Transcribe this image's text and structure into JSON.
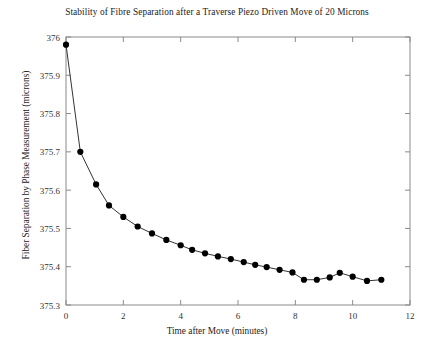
{
  "chart_data": {
    "type": "line",
    "title": "Stability of Fibre Separation after a Traverse Piezo Driven Move of 20 Microns",
    "xlabel": "Time after Move (minutes)",
    "ylabel": "Fiber Separation by Phase Measurement (microns)",
    "xlim": [
      0,
      12
    ],
    "ylim": [
      375.3,
      376.0
    ],
    "xticks": [
      0,
      2,
      4,
      6,
      8,
      10,
      12
    ],
    "xtick_labels": [
      "0",
      "2",
      "4",
      "6",
      "8",
      "10",
      "12"
    ],
    "yticks": [
      375.3,
      375.4,
      375.5,
      375.6,
      375.7,
      375.8,
      375.9,
      376.0
    ],
    "ytick_labels": [
      "375.3",
      "375.4",
      "375.5",
      "375.6",
      "375.7",
      "375.8",
      "375.9",
      "376"
    ],
    "grid": false,
    "legend": "none",
    "marker": "filled-circle",
    "marker_color": "#000000",
    "line_color": "#333333",
    "series": [
      {
        "name": "Fibre separation",
        "x": [
          0.0,
          0.5,
          1.05,
          1.5,
          2.0,
          2.5,
          3.0,
          3.5,
          4.0,
          4.4,
          4.85,
          5.3,
          5.75,
          6.2,
          6.6,
          7.0,
          7.45,
          7.9,
          8.3,
          8.75,
          9.2,
          9.55,
          10.0,
          10.5,
          11.0
        ],
        "y": [
          375.98,
          375.7,
          375.615,
          375.56,
          375.53,
          375.505,
          375.487,
          375.47,
          375.456,
          375.444,
          375.435,
          375.427,
          375.42,
          375.412,
          375.405,
          375.399,
          375.392,
          375.385,
          375.366,
          375.366,
          375.372,
          375.384,
          375.374,
          375.363,
          375.366
        ]
      }
    ]
  }
}
